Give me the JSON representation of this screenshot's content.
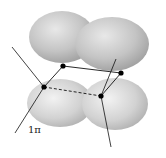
{
  "diagram": {
    "label": "1π",
    "colors": {
      "background": "#ffffff",
      "lobe": "#bdbdbd",
      "lobe_highlight": "#e6e6e6",
      "lobe_shadow": "#9a9a9a",
      "bond": "#111111",
      "atom": "#000000"
    },
    "atoms": [
      {
        "id": "a1",
        "x": 63,
        "y": 66
      },
      {
        "id": "a2",
        "x": 121,
        "y": 73
      },
      {
        "id": "a3",
        "x": 44,
        "y": 87
      },
      {
        "id": "a4",
        "x": 101,
        "y": 96
      }
    ],
    "bonds": [
      {
        "from": "a1",
        "to": "a2",
        "style": "solid"
      },
      {
        "from": "a3",
        "to": "a4",
        "style": "dashed"
      },
      {
        "from": "a3",
        "to": "a1",
        "style": "solid"
      },
      {
        "from": "a4",
        "to": "a2",
        "style": "solid"
      }
    ]
  }
}
